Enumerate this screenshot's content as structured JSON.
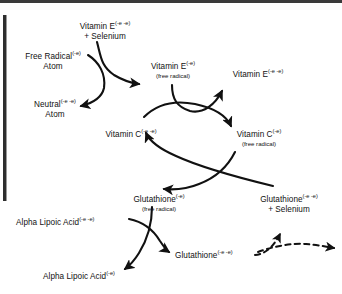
{
  "figure": {
    "type": "cycle-diagram",
    "title_visible": false,
    "ink_color": "#111111",
    "rule_color": "#3a3a3a"
  },
  "nodes": [
    {
      "id": "vitamin-e-selenium",
      "main": "Vitamin E",
      "sup": "(-e -e)",
      "line2": "+ Selenium",
      "note": ""
    },
    {
      "id": "free-radical-atom",
      "main": "Free Radical",
      "sup": "(-e)",
      "line2": "Atom",
      "note": ""
    },
    {
      "id": "neutral-atom",
      "main": "Neutral",
      "sup": "(-e -e)",
      "line2": "Atom",
      "note": ""
    },
    {
      "id": "vitamin-e-free-radical",
      "main": "Vitamin E",
      "sup": "(-e)",
      "line2": "",
      "note": "(free radical)"
    },
    {
      "id": "vitamin-e-reduced",
      "main": "Vitamin E",
      "sup": "(-e -e)",
      "line2": "",
      "note": ""
    },
    {
      "id": "vitamin-c-reduced",
      "main": "Vitamin C",
      "sup": "(-e -e)",
      "line2": "",
      "note": ""
    },
    {
      "id": "vitamin-c-free-radical",
      "main": "Vitamin C",
      "sup": "(-e)",
      "line2": "",
      "note": "(free radical)"
    },
    {
      "id": "glutathione-free-radical",
      "main": "Glutathione",
      "sup": "(-e)",
      "line2": "",
      "note": "(free radical)"
    },
    {
      "id": "glutathione-selenium",
      "main": "Glutathione",
      "sup": "(-e -e)",
      "line2": "+ Selenium",
      "note": ""
    },
    {
      "id": "alpha-lipoic-acid-reduced",
      "main": "Alpha Lipoic Acid",
      "sup": "(-e -e)",
      "line2": "",
      "note": ""
    },
    {
      "id": "glutathione-reduced",
      "main": "Glutathione",
      "sup": "(-e -e)",
      "line2": "",
      "note": ""
    },
    {
      "id": "alpha-lipoic-acid-oxidized",
      "main": "Alpha Lipoic Acid",
      "sup": "(-e)",
      "line2": "",
      "note": ""
    }
  ],
  "arrows": [
    {
      "id": "arrow-vitamin-e-selenium-to-vitamin-e-free-radical",
      "style": "solid"
    },
    {
      "id": "arrow-free-radical-atom-to-neutral-atom",
      "style": "solid"
    },
    {
      "id": "arrow-vitamin-e-free-radical-to-vitamin-e-reduced",
      "style": "solid"
    },
    {
      "id": "arrow-vitamin-c-reduced-to-vitamin-c-free-radical",
      "style": "solid"
    },
    {
      "id": "arrow-vitamin-c-free-radical-to-glutathione-free-radical",
      "style": "solid"
    },
    {
      "id": "arrow-glutathione-selenium-to-vitamin-c-reduced",
      "style": "solid"
    },
    {
      "id": "arrow-alpha-lipoic-acid-reduced-to-glutathione-reduced",
      "style": "solid"
    },
    {
      "id": "arrow-glutathione-free-radical-to-alpha-lipoic-acid-oxidized",
      "style": "solid"
    },
    {
      "id": "arrow-glutathione-reduced-to-glutathione-selenium",
      "style": "dashed"
    },
    {
      "id": "arrow-glutathione-reduced-to-offpage",
      "style": "dashed"
    }
  ]
}
